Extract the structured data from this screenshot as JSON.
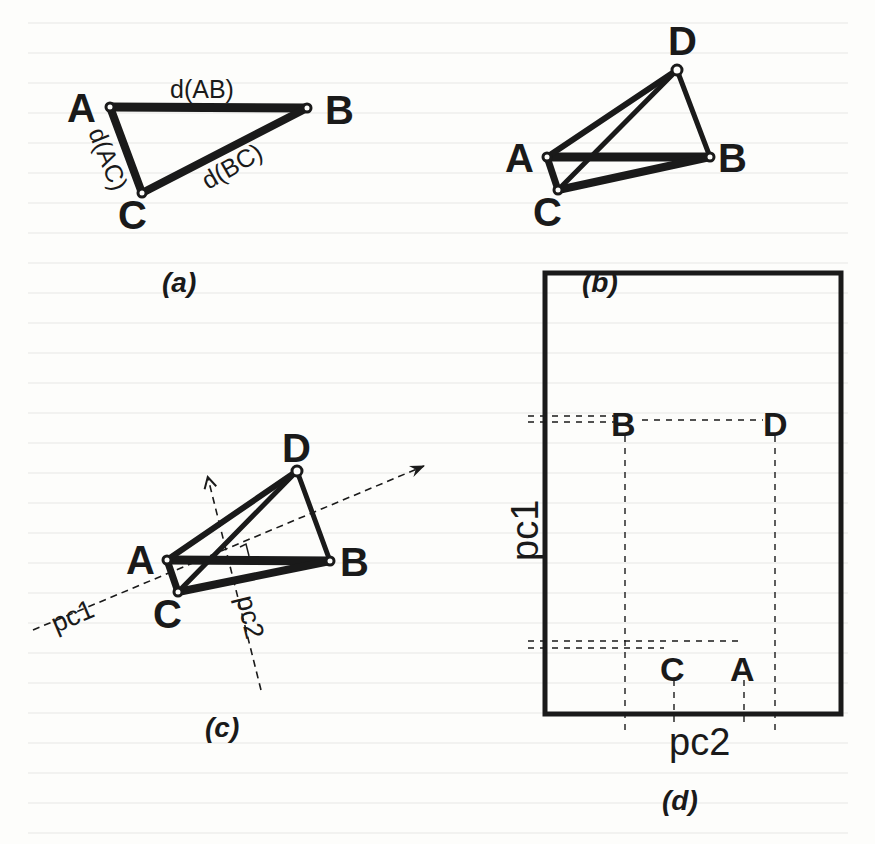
{
  "figure": {
    "panels": [
      {
        "id": "a",
        "caption": "(a)",
        "points": [
          {
            "name": "A",
            "x": 110,
            "y": 107
          },
          {
            "name": "B",
            "x": 307,
            "y": 108
          },
          {
            "name": "C",
            "x": 142,
            "y": 193
          }
        ],
        "edge_labels": {
          "ab": "d(AB)",
          "ac": "d(AC)",
          "bc": "d(BC)"
        }
      },
      {
        "id": "b",
        "caption": "(b)",
        "points": [
          {
            "name": "A",
            "x": 547,
            "y": 157
          },
          {
            "name": "B",
            "x": 710,
            "y": 157
          },
          {
            "name": "C",
            "x": 558,
            "y": 190
          },
          {
            "name": "D",
            "x": 677,
            "y": 70
          }
        ]
      },
      {
        "id": "c",
        "caption": "(c)",
        "points": [
          {
            "name": "A",
            "x": 167,
            "y": 560
          },
          {
            "name": "B",
            "x": 330,
            "y": 561
          },
          {
            "name": "C",
            "x": 178,
            "y": 592
          },
          {
            "name": "D",
            "x": 297,
            "y": 471
          }
        ],
        "axes": {
          "pc1": "pc1",
          "pc2": "pc2"
        }
      },
      {
        "id": "d",
        "caption": "(d)",
        "points": [
          {
            "name": "B",
            "x": 624,
            "y": 420
          },
          {
            "name": "D",
            "x": 771,
            "y": 420
          },
          {
            "name": "C",
            "x": 677,
            "y": 665
          },
          {
            "name": "A",
            "x": 745,
            "y": 665
          }
        ],
        "axes": {
          "x_label": "pc2",
          "y_label": "pc1"
        }
      }
    ]
  },
  "labels": {
    "a": {
      "A": "A",
      "B": "B",
      "C": "C",
      "caption": "(a)",
      "dAB": "d(AB)",
      "dAC": "d(AC)",
      "dBC": "d(BC)"
    },
    "b": {
      "A": "A",
      "B": "B",
      "C": "C",
      "D": "D",
      "caption": "(b)"
    },
    "c": {
      "A": "A",
      "B": "B",
      "C": "C",
      "D": "D",
      "caption": "(c)",
      "pc1": "pc1",
      "pc2": "pc2"
    },
    "d": {
      "A": "A",
      "B": "B",
      "C": "C",
      "D": "D",
      "caption": "(d)",
      "pc1": "pc1",
      "pc2": "pc2"
    }
  },
  "colors": {
    "ink": "#1a1a1a",
    "paper": "#fdfdfb"
  }
}
